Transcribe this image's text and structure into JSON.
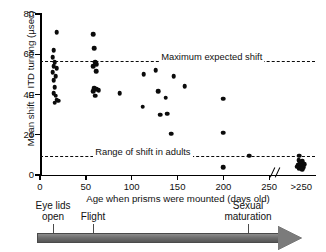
{
  "chart_data": {
    "type": "scatter",
    "title": "",
    "xlabel": "Age when prisms were mounted (days old)",
    "ylabel": "Mean shift in ITD turning (µsec)",
    "xlim": [
      0,
      250
    ],
    "ylim": [
      0,
      80
    ],
    "grid": false,
    "legend": "none",
    "axis_break": {
      "symbol": "//",
      "after_tick": 250,
      "extra_category": ">250"
    },
    "xticks": [
      {
        "value": 0,
        "label": "0"
      },
      {
        "value": 50,
        "label": "50"
      },
      {
        "value": 100,
        "label": "100"
      },
      {
        "value": 150,
        "label": "150"
      },
      {
        "value": 200,
        "label": "200"
      },
      {
        "value": 250,
        "label": "250"
      },
      {
        "value": 285,
        "label": ">250"
      }
    ],
    "yticks": [
      {
        "value": 0,
        "label": "0"
      },
      {
        "value": 20,
        "label": "20"
      },
      {
        "value": 40,
        "label": "40"
      },
      {
        "value": 60,
        "label": "60"
      },
      {
        "value": 80,
        "label": "80"
      }
    ],
    "reference_lines": [
      {
        "name": "maximum-expected-shift",
        "y": 56.5,
        "label": "Maximum expected shift",
        "style": "dashed",
        "label_x": 130
      },
      {
        "name": "range-of-shift-in-adults",
        "y": 9.5,
        "label": "Range of shift in adults",
        "style": "dashed",
        "label_x": 58
      }
    ],
    "points": [
      {
        "x": 18,
        "y": 71
      },
      {
        "x": 15,
        "y": 62
      },
      {
        "x": 14,
        "y": 58.5
      },
      {
        "x": 16,
        "y": 56
      },
      {
        "x": 15,
        "y": 54
      },
      {
        "x": 18,
        "y": 53
      },
      {
        "x": 14,
        "y": 51
      },
      {
        "x": 17,
        "y": 49
      },
      {
        "x": 15,
        "y": 47
      },
      {
        "x": 16,
        "y": 43.5
      },
      {
        "x": 15,
        "y": 40.5
      },
      {
        "x": 17,
        "y": 39.5
      },
      {
        "x": 18,
        "y": 37.5
      },
      {
        "x": 20,
        "y": 37
      },
      {
        "x": 16,
        "y": 36
      },
      {
        "x": 58,
        "y": 70
      },
      {
        "x": 59,
        "y": 63
      },
      {
        "x": 60,
        "y": 56
      },
      {
        "x": 62,
        "y": 55
      },
      {
        "x": 58,
        "y": 54
      },
      {
        "x": 61,
        "y": 51.5
      },
      {
        "x": 59,
        "y": 43
      },
      {
        "x": 62,
        "y": 42.5
      },
      {
        "x": 64,
        "y": 42
      },
      {
        "x": 58,
        "y": 41.5
      },
      {
        "x": 60,
        "y": 39.5
      },
      {
        "x": 87,
        "y": 40.5
      },
      {
        "x": 113,
        "y": 50
      },
      {
        "x": 112,
        "y": 34
      },
      {
        "x": 126,
        "y": 52
      },
      {
        "x": 129,
        "y": 41.5
      },
      {
        "x": 131,
        "y": 30
      },
      {
        "x": 137,
        "y": 38.5
      },
      {
        "x": 139,
        "y": 30.5
      },
      {
        "x": 143,
        "y": 20.5
      },
      {
        "x": 146,
        "y": 49
      },
      {
        "x": 158,
        "y": 44
      },
      {
        "x": 200,
        "y": 38
      },
      {
        "x": 200,
        "y": 21
      },
      {
        "x": 200,
        "y": 4
      },
      {
        "x": 228,
        "y": 9.5
      },
      {
        "x": 283,
        "y": 9.5
      },
      {
        "x": 282,
        "y": 7.5
      },
      {
        "x": 286,
        "y": 7
      },
      {
        "x": 284,
        "y": 6
      },
      {
        "x": 288,
        "y": 5.5
      },
      {
        "x": 281,
        "y": 5
      },
      {
        "x": 285,
        "y": 4.5
      },
      {
        "x": 287,
        "y": 4
      },
      {
        "x": 283,
        "y": 3.5
      },
      {
        "x": 286,
        "y": 3
      },
      {
        "x": 280,
        "y": 4.2
      }
    ]
  },
  "timeline": {
    "markers": [
      {
        "name": "eye-lids-open",
        "label_line1": "Eye lids",
        "label_line2": "open",
        "x": 53,
        "label_x": 53
      },
      {
        "name": "flight",
        "label_line1": "Flight",
        "label_line2": "",
        "x": 93,
        "label_x": 93
      },
      {
        "name": "sexual-maturation",
        "label_line1": "Sexual",
        "label_line2": "maturation",
        "x": 248,
        "label_x": 248
      }
    ]
  }
}
